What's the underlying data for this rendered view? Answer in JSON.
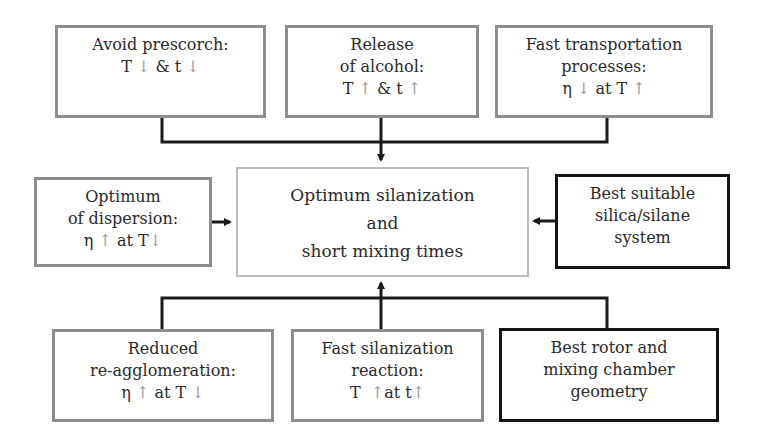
{
  "diagram": {
    "center": {
      "lines": [
        "Optimum silanization",
        "and",
        "short mixing times"
      ]
    },
    "top": [
      {
        "lines": [
          "Avoid prescorch:"
        ],
        "formula": {
          "a": "T",
          "a_arrow": "↓",
          "mid": " & t ",
          "b_arrow": "↓"
        }
      },
      {
        "lines": [
          "Release",
          "of alcohol:"
        ],
        "formula": {
          "a": "T",
          "a_arrow": "↑",
          "mid": " & t ",
          "b_arrow": "↑"
        }
      },
      {
        "lines": [
          "Fast transportation",
          "processes:"
        ],
        "formula": {
          "a": "η",
          "a_arrow": "↓",
          "mid": " at T ",
          "b_arrow": "↑"
        }
      }
    ],
    "left": {
      "lines": [
        "Optimum",
        "of dispersion:"
      ],
      "formula": {
        "a": "η",
        "a_arrow": "↑",
        "mid": " at T",
        "b_arrow": "↓"
      }
    },
    "right": {
      "lines": [
        "Best suitable",
        "silica/silane",
        "system"
      ]
    },
    "bottom": [
      {
        "lines": [
          "Reduced",
          "re-agglomeration:"
        ],
        "formula": {
          "a": "η",
          "a_arrow": "↑",
          "mid": " at T ",
          "b_arrow": "↓"
        }
      },
      {
        "lines": [
          "Fast silanization",
          "reaction:"
        ],
        "formula": {
          "a": "T  ",
          "a_arrow": "↑",
          "mid": "at t",
          "b_arrow": "↑"
        }
      },
      {
        "lines": [
          "Best rotor and",
          "mixing chamber",
          "geometry"
        ]
      }
    ],
    "colors": {
      "gray_border": "#8d8d8d",
      "light_border": "#bdbdbd",
      "dark_border": "#141414",
      "arrow_glyph": "#9a9a9a",
      "connector": "#1a1a1a"
    }
  }
}
